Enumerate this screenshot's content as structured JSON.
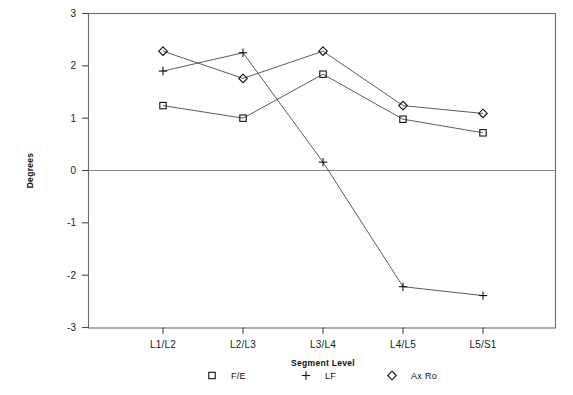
{
  "chart_data": {
    "type": "line",
    "title": "",
    "xlabel": "Segment Level",
    "ylabel": "Degrees",
    "categories": [
      "L1/L2",
      "L2/L3",
      "L3/L4",
      "L4/L5",
      "L5/S1"
    ],
    "ylim": [
      -3,
      3
    ],
    "yticks": [
      3,
      2,
      1,
      0,
      -1,
      -2,
      -3
    ],
    "ytick_labels": [
      "3",
      "2",
      "1",
      "0",
      "-1",
      "-2",
      "-3"
    ],
    "grid": false,
    "zero_line": true,
    "legend_position": "bottom",
    "series": [
      {
        "name": "F/E",
        "marker": "square",
        "values": [
          1.24,
          1.0,
          1.84,
          0.98,
          0.72
        ]
      },
      {
        "name": "LF",
        "marker": "plus",
        "values": [
          1.9,
          2.25,
          0.16,
          -2.22,
          -2.39
        ]
      },
      {
        "name": "Ax Ro",
        "marker": "diamond",
        "values": [
          2.28,
          1.76,
          2.28,
          1.24,
          1.09
        ]
      }
    ]
  },
  "axes": {
    "y_label": "Degrees",
    "x_label": "Segment Level",
    "y_tick_labels": [
      "3",
      "2",
      "1",
      "0",
      "-1",
      "-2",
      "-3"
    ],
    "x_tick_labels": [
      "L1/L2",
      "L2/L3",
      "L3/L4",
      "L4/L5",
      "L5/S1"
    ]
  },
  "legend": {
    "entries": [
      {
        "marker": "square-marker",
        "label": "F/E"
      },
      {
        "marker": "plus-marker",
        "label": "LF"
      },
      {
        "marker": "diamond-marker",
        "label": "Ax Ro"
      }
    ]
  },
  "colors": {
    "line": "#4a4a4a",
    "marker": "#111111",
    "frame": "#6b6b6b",
    "text": "#1a1a1a",
    "background": "#ffffff"
  }
}
